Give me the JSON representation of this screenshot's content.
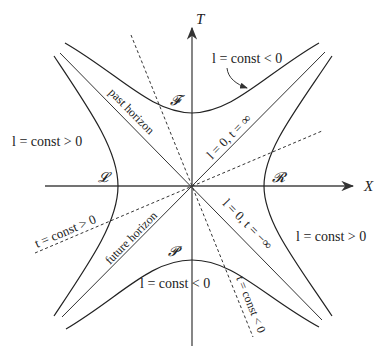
{
  "diagram": {
    "title": "",
    "axes": {
      "vertical": "T",
      "horizontal": "X"
    },
    "regions": {
      "future": "𝓕",
      "past": "𝓟",
      "left": "𝓛",
      "right": "𝓡"
    },
    "labels": {
      "top_right": "l = const < 0",
      "bottom": "l = const < 0",
      "left": "l = const > 0",
      "right": "l = const > 0",
      "past_horizon": "past horizon",
      "future_horizon": "future horizon",
      "diag_upper_right": "l = 0, t = ∞",
      "diag_lower_right": "l = 0, t = −∞",
      "dashed_left": "t = const > 0",
      "dashed_lower": "t = const < 0"
    },
    "colors": {
      "line": "#222222",
      "background": "#ffffff"
    }
  }
}
